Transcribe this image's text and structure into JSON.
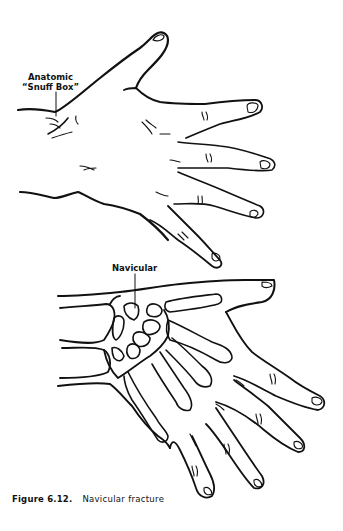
{
  "figure": {
    "number": "Figure 6.12.",
    "caption": "Navicular fracture",
    "labels": {
      "snuff_box_line1": "Anatomic",
      "snuff_box_line2": "“Snuff Box”",
      "navicular": "Navicular"
    },
    "panels": [
      {
        "name": "dorsal-hand",
        "description": "Outline of the back of the hand showing the anatomic snuff box"
      },
      {
        "name": "hand-skeleton",
        "description": "Hand outline with carpal and metacarpal bones showing the navicular"
      }
    ],
    "colors": {
      "ink": "#111111",
      "paper": "#ffffff"
    }
  }
}
